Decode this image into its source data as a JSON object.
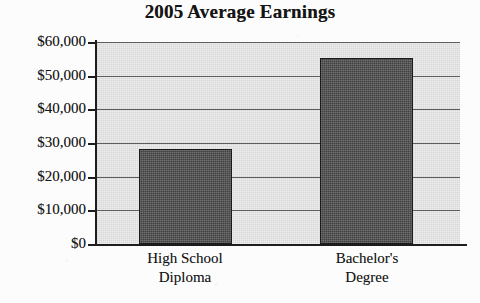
{
  "chart_data": {
    "type": "bar",
    "title": "2005 Average Earnings",
    "xlabel": "",
    "ylabel": "",
    "categories": [
      "High School Diploma",
      "Bachelor's Degree"
    ],
    "category_lines": [
      [
        "High School",
        "Diploma"
      ],
      [
        "Bachelor's",
        "Degree"
      ]
    ],
    "values": [
      28300,
      55100
    ],
    "ylim": [
      0,
      60000
    ],
    "ytick_values": [
      60000,
      50000,
      40000,
      30000,
      20000,
      10000,
      0
    ],
    "ytick_labels": [
      "$60,000",
      "$50,000",
      "$40,000",
      "$30,000",
      "$20,000",
      "$10,000",
      "$0"
    ],
    "grid": true,
    "legend": false,
    "colors": {
      "bar_fill": "#4f4f4f",
      "bar_border": "#1a1a1a",
      "plot_background": "#dcdcdc",
      "gridline": "#5d5d5d",
      "axis": "#1d1d1d",
      "text": "#151515",
      "page_background": "#fcfcfc"
    }
  }
}
